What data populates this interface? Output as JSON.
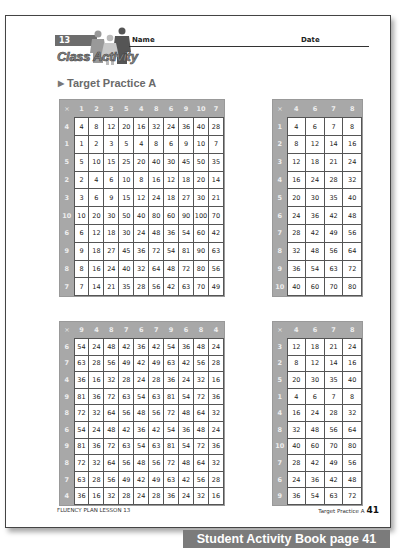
{
  "header": {
    "lesson_number": "13",
    "badge_title": "Class Activity",
    "name_label": "Name",
    "date_label": "Date",
    "section_arrow": "▶",
    "section_title": "Target Practice A"
  },
  "tables": [
    {
      "corner": "×",
      "columns": [
        "1",
        "2",
        "3",
        "5",
        "4",
        "8",
        "6",
        "9",
        "10",
        "7"
      ],
      "rows": [
        {
          "head": "4",
          "cells": [
            "4",
            "8",
            "12",
            "20",
            "16",
            "32",
            "24",
            "36",
            "40",
            "28"
          ]
        },
        {
          "head": "1",
          "cells": [
            "1",
            "2",
            "3",
            "5",
            "4",
            "8",
            "6",
            "9",
            "10",
            "7"
          ]
        },
        {
          "head": "5",
          "cells": [
            "5",
            "10",
            "15",
            "25",
            "20",
            "40",
            "30",
            "45",
            "50",
            "35"
          ]
        },
        {
          "head": "2",
          "cells": [
            "2",
            "4",
            "6",
            "10",
            "8",
            "16",
            "12",
            "18",
            "20",
            "14"
          ]
        },
        {
          "head": "3",
          "cells": [
            "3",
            "6",
            "9",
            "15",
            "12",
            "24",
            "18",
            "27",
            "30",
            "21"
          ]
        },
        {
          "head": "10",
          "cells": [
            "10",
            "20",
            "30",
            "50",
            "40",
            "80",
            "60",
            "90",
            "100",
            "70"
          ]
        },
        {
          "head": "6",
          "cells": [
            "6",
            "12",
            "18",
            "30",
            "24",
            "48",
            "36",
            "54",
            "60",
            "42"
          ]
        },
        {
          "head": "9",
          "cells": [
            "9",
            "18",
            "27",
            "45",
            "36",
            "72",
            "54",
            "81",
            "90",
            "63"
          ]
        },
        {
          "head": "8",
          "cells": [
            "8",
            "16",
            "24",
            "40",
            "32",
            "64",
            "48",
            "72",
            "80",
            "56"
          ]
        },
        {
          "head": "7",
          "cells": [
            "7",
            "14",
            "21",
            "35",
            "28",
            "56",
            "42",
            "63",
            "70",
            "49"
          ]
        }
      ]
    },
    {
      "corner": "×",
      "columns": [
        "4",
        "6",
        "7",
        "8"
      ],
      "rows": [
        {
          "head": "1",
          "cells": [
            "4",
            "6",
            "7",
            "8"
          ]
        },
        {
          "head": "2",
          "cells": [
            "8",
            "12",
            "14",
            "16"
          ]
        },
        {
          "head": "3",
          "cells": [
            "12",
            "18",
            "21",
            "24"
          ]
        },
        {
          "head": "4",
          "cells": [
            "16",
            "24",
            "28",
            "32"
          ]
        },
        {
          "head": "5",
          "cells": [
            "20",
            "30",
            "35",
            "40"
          ]
        },
        {
          "head": "6",
          "cells": [
            "24",
            "36",
            "42",
            "48"
          ]
        },
        {
          "head": "7",
          "cells": [
            "28",
            "42",
            "49",
            "56"
          ]
        },
        {
          "head": "8",
          "cells": [
            "32",
            "48",
            "56",
            "64"
          ]
        },
        {
          "head": "9",
          "cells": [
            "36",
            "54",
            "63",
            "72"
          ]
        },
        {
          "head": "10",
          "cells": [
            "40",
            "60",
            "70",
            "80"
          ]
        }
      ]
    },
    {
      "corner": "×",
      "columns": [
        "9",
        "4",
        "8",
        "7",
        "6",
        "7",
        "9",
        "6",
        "8",
        "4"
      ],
      "rows": [
        {
          "head": "6",
          "cells": [
            "54",
            "24",
            "48",
            "42",
            "36",
            "42",
            "54",
            "36",
            "48",
            "24"
          ]
        },
        {
          "head": "7",
          "cells": [
            "63",
            "28",
            "56",
            "49",
            "42",
            "49",
            "63",
            "42",
            "56",
            "28"
          ]
        },
        {
          "head": "4",
          "cells": [
            "36",
            "16",
            "32",
            "28",
            "24",
            "28",
            "36",
            "24",
            "32",
            "16"
          ]
        },
        {
          "head": "9",
          "cells": [
            "81",
            "36",
            "72",
            "63",
            "54",
            "63",
            "81",
            "54",
            "72",
            "36"
          ]
        },
        {
          "head": "8",
          "cells": [
            "72",
            "32",
            "64",
            "56",
            "48",
            "56",
            "72",
            "48",
            "64",
            "32"
          ]
        },
        {
          "head": "6",
          "cells": [
            "54",
            "24",
            "48",
            "42",
            "36",
            "42",
            "54",
            "36",
            "48",
            "24"
          ]
        },
        {
          "head": "9",
          "cells": [
            "81",
            "36",
            "72",
            "63",
            "54",
            "63",
            "81",
            "54",
            "72",
            "36"
          ]
        },
        {
          "head": "8",
          "cells": [
            "72",
            "32",
            "64",
            "56",
            "48",
            "56",
            "72",
            "48",
            "64",
            "32"
          ]
        },
        {
          "head": "7",
          "cells": [
            "63",
            "28",
            "56",
            "49",
            "42",
            "49",
            "63",
            "42",
            "56",
            "28"
          ]
        },
        {
          "head": "4",
          "cells": [
            "36",
            "16",
            "32",
            "28",
            "24",
            "28",
            "36",
            "24",
            "32",
            "16"
          ]
        }
      ]
    },
    {
      "corner": "×",
      "columns": [
        "4",
        "6",
        "7",
        "8"
      ],
      "rows": [
        {
          "head": "3",
          "cells": [
            "12",
            "18",
            "21",
            "24"
          ]
        },
        {
          "head": "2",
          "cells": [
            "8",
            "12",
            "14",
            "16"
          ]
        },
        {
          "head": "5",
          "cells": [
            "20",
            "30",
            "35",
            "40"
          ]
        },
        {
          "head": "1",
          "cells": [
            "4",
            "6",
            "7",
            "8"
          ]
        },
        {
          "head": "4",
          "cells": [
            "16",
            "24",
            "28",
            "32"
          ]
        },
        {
          "head": "8",
          "cells": [
            "32",
            "48",
            "56",
            "64"
          ]
        },
        {
          "head": "10",
          "cells": [
            "40",
            "60",
            "70",
            "80"
          ]
        },
        {
          "head": "7",
          "cells": [
            "28",
            "42",
            "49",
            "56"
          ]
        },
        {
          "head": "6",
          "cells": [
            "24",
            "36",
            "42",
            "48"
          ]
        },
        {
          "head": "9",
          "cells": [
            "36",
            "54",
            "63",
            "72"
          ]
        }
      ]
    }
  ],
  "footer": {
    "left": "FLUENCY PLAN LESSON 13",
    "right_label": "Target Practice A",
    "page_number": "41"
  },
  "banner": "Student Activity Book page 41",
  "colors": {
    "header_gray": "#a8a8a8",
    "banner_gray": "#7b7b7b",
    "title_gray": "#6a6a6a"
  }
}
